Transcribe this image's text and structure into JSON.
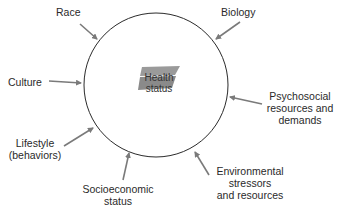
{
  "diagram": {
    "center": {
      "line1": "Health",
      "line2": "status"
    },
    "factors": [
      {
        "id": "race",
        "lines": [
          "Race"
        ]
      },
      {
        "id": "biology",
        "lines": [
          "Biology"
        ]
      },
      {
        "id": "culture",
        "lines": [
          "Culture"
        ]
      },
      {
        "id": "psychosocial",
        "lines": [
          "Psychosocial",
          "resources and",
          "demands"
        ]
      },
      {
        "id": "lifestyle",
        "lines": [
          "Lifestyle",
          "(behaviors)"
        ]
      },
      {
        "id": "environmental",
        "lines": [
          "Environmental",
          "stressors",
          "and resources"
        ]
      },
      {
        "id": "socioeconomic",
        "lines": [
          "Socioeconomic",
          "status"
        ]
      }
    ],
    "colors": {
      "circle": "#2b2b2b",
      "arrow": "#7a7a7a",
      "center_shape": "#8a8a8a"
    }
  }
}
